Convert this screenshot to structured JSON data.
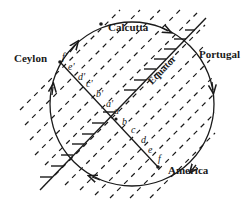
{
  "diagram": {
    "places": {
      "calcutta": "Calcutta",
      "ceylon": "Ceylon",
      "portugal": "Portugal",
      "america": "America"
    },
    "equator_label": "Equator",
    "chord_points_upper": [
      "a'",
      "b'",
      "c'",
      "d'",
      "e'",
      "f'"
    ],
    "chord_points_lower": [
      "a",
      "b",
      "c",
      "d",
      "e",
      "f"
    ],
    "colors": {
      "ink": "#1a1a1a",
      "background": "#ffffff"
    }
  }
}
